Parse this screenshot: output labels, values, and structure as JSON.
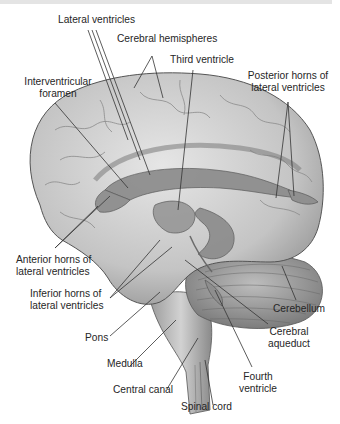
{
  "diagram": {
    "labels": {
      "lateral_ventricles": "Lateral ventricles",
      "cerebral_hemispheres": "Cerebral hemispheres",
      "third_ventricle": "Third ventricle",
      "interventricular_foramen_1": "Interventricular",
      "interventricular_foramen_2": "foramen",
      "posterior_horns_1": "Posterior horns of",
      "posterior_horns_2": "lateral ventricles",
      "anterior_horns_1": "Anterior horns of",
      "anterior_horns_2": "lateral ventricles",
      "inferior_horns_1": "Inferior horns of",
      "inferior_horns_2": "lateral ventricles",
      "cerebellum": "Cerebellum",
      "cerebral_aqueduct_1": "Cerebral",
      "cerebral_aqueduct_2": "aqueduct",
      "pons": "Pons",
      "medulla": "Medulla",
      "fourth_ventricle_1": "Fourth",
      "fourth_ventricle_2": "ventricle",
      "central_canal": "Central canal",
      "spinal_cord": "Spinal cord"
    },
    "colors": {
      "brain_fill": "#c9c9c9",
      "ventricle_fill": "#8e8e8e",
      "leader_line": "#333333",
      "text": "#262626"
    }
  }
}
